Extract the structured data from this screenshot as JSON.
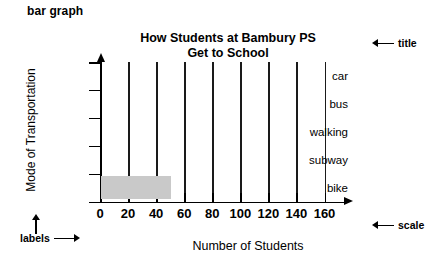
{
  "caption": "bar graph",
  "annotations": {
    "title_note": "title",
    "scale_note": "scale",
    "labels_note": "labels"
  },
  "chart_data": {
    "type": "bar",
    "orientation": "horizontal",
    "title": "How Students at Bambury PS Get to School",
    "title_line1": "How Students at Bambury PS",
    "title_line2": "Get to School",
    "xlabel": "Number of Students",
    "ylabel": "Mode of Transportation",
    "categories": [
      "car",
      "bus",
      "walking",
      "subway",
      "bike"
    ],
    "values": [
      0,
      0,
      0,
      0,
      50
    ],
    "xticks": [
      0,
      20,
      40,
      60,
      80,
      100,
      120,
      140,
      160
    ],
    "xtick_labels": [
      "0",
      "20",
      "40",
      "60",
      "80",
      "100",
      "120",
      "140",
      "160"
    ],
    "xlim": [
      0,
      160
    ],
    "grid": "vertical",
    "legend": "none",
    "bar_color": "#c9c9c9",
    "axis_color": "#000000"
  }
}
